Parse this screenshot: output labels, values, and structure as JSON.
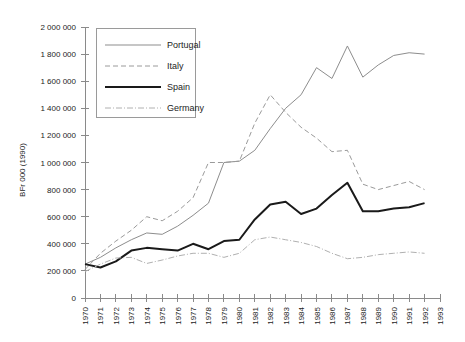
{
  "chart_data": {
    "type": "line",
    "title": "",
    "xlabel": "",
    "ylabel": "BFr 000 (1990)",
    "ylim": [
      0,
      2000000
    ],
    "xlim": [
      1970,
      1993
    ],
    "grid": false,
    "legend_position": "top-left-inside",
    "y_ticks": [
      0,
      200000,
      400000,
      600000,
      800000,
      1000000,
      1200000,
      1400000,
      1600000,
      1800000,
      2000000
    ],
    "y_tick_labels": [
      "0",
      "200 000",
      "400 000",
      "600 000",
      "800 000",
      "1 000 000",
      "1 200 000",
      "1 400 000",
      "1 600 000",
      "1 800 000",
      "2 000 000"
    ],
    "x": [
      1970,
      1971,
      1972,
      1973,
      1974,
      1975,
      1976,
      1977,
      1978,
      1979,
      1980,
      1981,
      1982,
      1983,
      1984,
      1985,
      1986,
      1987,
      1988,
      1989,
      1990,
      1991,
      1992
    ],
    "x_tick_labels": [
      "1970",
      "1971",
      "1972",
      "1973",
      "1974",
      "1975",
      "1976",
      "1977",
      "1978",
      "1979",
      "1980",
      "1981",
      "1982",
      "1983",
      "1984",
      "1985",
      "1986",
      "1987",
      "1988",
      "1989",
      "1990",
      "1991",
      "1992",
      "1993"
    ],
    "series": [
      {
        "name": "Portugal",
        "style": "solid-thin",
        "color": "#8d8d8d",
        "width": 1,
        "dash": "none",
        "values": [
          250000,
          300000,
          370000,
          430000,
          480000,
          470000,
          530000,
          610000,
          700000,
          1000000,
          1010000,
          1090000,
          1250000,
          1400000,
          1500000,
          1700000,
          1620000,
          1860000,
          1630000,
          1720000,
          1790000,
          1810000,
          1800000
        ]
      },
      {
        "name": "Italy",
        "style": "dashed",
        "color": "#9a9a9a",
        "width": 1,
        "dash": "5,3",
        "values": [
          210000,
          330000,
          420000,
          500000,
          600000,
          570000,
          640000,
          740000,
          1000000,
          1000000,
          1010000,
          1290000,
          1500000,
          1370000,
          1260000,
          1180000,
          1080000,
          1090000,
          840000,
          800000,
          830000,
          860000,
          800000
        ]
      },
      {
        "name": "Spain",
        "style": "solid-thick",
        "color": "#1a1a1a",
        "width": 2,
        "dash": "none",
        "values": [
          250000,
          225000,
          270000,
          350000,
          370000,
          360000,
          350000,
          400000,
          360000,
          420000,
          430000,
          580000,
          690000,
          710000,
          620000,
          660000,
          760000,
          850000,
          640000,
          640000,
          660000,
          670000,
          700000
        ]
      },
      {
        "name": "Germany",
        "style": "dash-dot",
        "color": "#b0b0b0",
        "width": 1,
        "dash": "6,2,1,2",
        "values": [
          195000,
          250000,
          295000,
          300000,
          255000,
          280000,
          310000,
          330000,
          330000,
          300000,
          330000,
          430000,
          450000,
          430000,
          410000,
          380000,
          330000,
          290000,
          300000,
          320000,
          330000,
          340000,
          330000
        ]
      }
    ]
  },
  "legend": {
    "items": [
      {
        "label": "Portugal"
      },
      {
        "label": "Italy"
      },
      {
        "label": "Spain"
      },
      {
        "label": "Germany"
      }
    ]
  }
}
